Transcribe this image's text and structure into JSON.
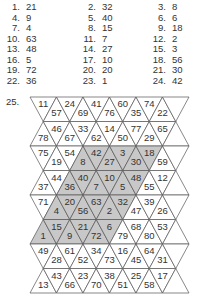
{
  "answers": [
    {
      "n": "1.",
      "v": "21"
    },
    {
      "n": "2.",
      "v": "32"
    },
    {
      "n": "3.",
      "v": "8"
    },
    {
      "n": "4.",
      "v": "9"
    },
    {
      "n": "5.",
      "v": "40"
    },
    {
      "n": "6.",
      "v": "6"
    },
    {
      "n": "7.",
      "v": "4"
    },
    {
      "n": "8.",
      "v": "15"
    },
    {
      "n": "9.",
      "v": "18"
    },
    {
      "n": "10.",
      "v": "63"
    },
    {
      "n": "11.",
      "v": "7"
    },
    {
      "n": "12.",
      "v": "2"
    },
    {
      "n": "13.",
      "v": "48"
    },
    {
      "n": "14.",
      "v": "27"
    },
    {
      "n": "15.",
      "v": "3"
    },
    {
      "n": "16.",
      "v": "5"
    },
    {
      "n": "17.",
      "v": "10"
    },
    {
      "n": "18.",
      "v": "56"
    },
    {
      "n": "19.",
      "v": "72"
    },
    {
      "n": "20.",
      "v": "20"
    },
    {
      "n": "21.",
      "v": "30"
    },
    {
      "n": "22.",
      "v": "36"
    },
    {
      "n": "23.",
      "v": "1"
    },
    {
      "n": "24.",
      "v": "42"
    }
  ],
  "grid_label": "25.",
  "colors": {
    "shade": "#c8c8c8",
    "line": "#555555",
    "text": "#333333"
  },
  "grid": {
    "rows": [
      {
        "first": "down",
        "cells": [
          "11",
          "57",
          "24",
          "69",
          "41",
          "76",
          "60",
          "35",
          "74",
          "22",
          ""
        ],
        "shaded": []
      },
      {
        "first": "up",
        "cells": [
          "78",
          "46",
          "67",
          "33",
          "62",
          "14",
          "50",
          "77",
          "29",
          "65",
          ""
        ],
        "shaded": []
      },
      {
        "first": "down",
        "cells": [
          "75",
          "19",
          "54",
          "8",
          "42",
          "27",
          "3",
          "30",
          "18",
          "59",
          ""
        ],
        "shaded": [
          3,
          4,
          5,
          6,
          7,
          8
        ]
      },
      {
        "first": "up",
        "cells": [
          "37",
          "44",
          "36",
          "40",
          "7",
          "10",
          "5",
          "48",
          "55",
          "12",
          ""
        ],
        "shaded": [
          2,
          3,
          4,
          5,
          6,
          7
        ]
      },
      {
        "first": "down",
        "cells": [
          "71",
          "4",
          "20",
          "56",
          "63",
          "2",
          "32",
          "47",
          "39",
          "26",
          ""
        ],
        "shaded": [
          1,
          2,
          3,
          4,
          5,
          6
        ]
      },
      {
        "first": "up",
        "cells": [
          "1",
          "15",
          "9",
          "21",
          "72",
          "6",
          "79",
          "68",
          "80",
          "53",
          ""
        ],
        "shaded": [
          0,
          1,
          2,
          3,
          4,
          5
        ]
      },
      {
        "first": "down",
        "cells": [
          "49",
          "28",
          "61",
          "52",
          "34",
          "73",
          "16",
          "45",
          "64",
          "31",
          ""
        ],
        "shaded": []
      },
      {
        "first": "up",
        "cells": [
          "13",
          "43",
          "66",
          "23",
          "70",
          "38",
          "51",
          "25",
          "58",
          "17",
          ""
        ],
        "shaded": []
      }
    ]
  }
}
